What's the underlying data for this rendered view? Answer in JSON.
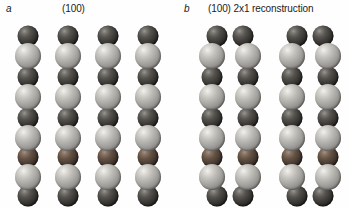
{
  "figure": {
    "width": 350,
    "height": 209,
    "background": "#fefefe"
  },
  "panels": [
    {
      "id": "panel-a",
      "letter": "a",
      "letter_x": 6,
      "title": "(100)",
      "title_x": 62,
      "structure": "unreconstructed",
      "columns": [
        {
          "cx": 28,
          "dimer_shift": 0
        },
        {
          "cx": 68,
          "dimer_shift": 0
        },
        {
          "cx": 108,
          "dimer_shift": 0
        },
        {
          "cx": 148,
          "dimer_shift": 0
        }
      ]
    },
    {
      "id": "panel-b",
      "letter": "b",
      "letter_x": 184,
      "title": "(100) 2x1 reconstruction",
      "title_x": 208,
      "structure": "2x1-dimerized",
      "columns": [
        {
          "cx": 212,
          "dimer_shift": 5
        },
        {
          "cx": 248,
          "dimer_shift": -5
        },
        {
          "cx": 292,
          "dimer_shift": 5
        },
        {
          "cx": 328,
          "dimer_shift": -5
        }
      ]
    }
  ],
  "atom_rows": [
    {
      "row": 0,
      "cy": 36,
      "shade": "dark",
      "diameter": 21,
      "dimerized": true
    },
    {
      "row": 1,
      "cy": 56,
      "shade": "light",
      "diameter": 26,
      "dimerized": false
    },
    {
      "row": 2,
      "cy": 77,
      "shade": "dark",
      "diameter": 21,
      "dimerized": false
    },
    {
      "row": 3,
      "cy": 97,
      "shade": "light",
      "diameter": 26,
      "dimerized": false
    },
    {
      "row": 4,
      "cy": 118,
      "shade": "dark",
      "diameter": 21,
      "dimerized": false
    },
    {
      "row": 5,
      "cy": 138,
      "shade": "light",
      "diameter": 26,
      "dimerized": false
    },
    {
      "row": 6,
      "cy": 157,
      "shade": "warm",
      "diameter": 21,
      "dimerized": false
    },
    {
      "row": 7,
      "cy": 177,
      "shade": "light",
      "diameter": 26,
      "dimerized": false
    },
    {
      "row": 8,
      "cy": 196,
      "shade": "dark",
      "diameter": 21,
      "dimerized": true
    }
  ],
  "colors": {
    "atom_dark": "#3d3b37",
    "atom_light": "#c3c1bc",
    "atom_warm": "#655445",
    "text": "#1b1b1b",
    "background": "#fefefe"
  }
}
